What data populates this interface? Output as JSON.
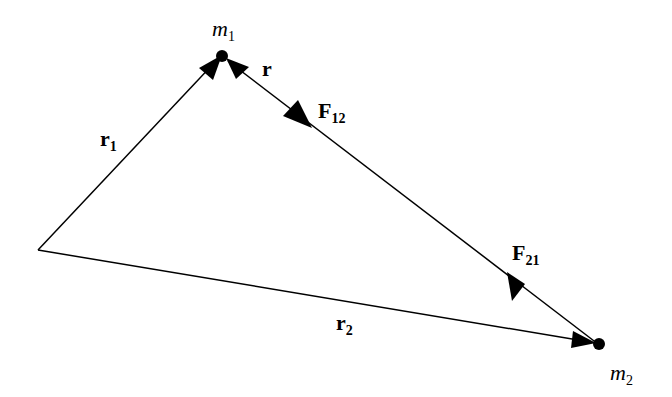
{
  "diagram": {
    "type": "gravitational-force-vectors",
    "points": {
      "origin": {
        "x": 38,
        "y": 250
      },
      "m1": {
        "x": 222,
        "y": 55
      },
      "m2": {
        "x": 598,
        "y": 344
      }
    },
    "labels": {
      "m1": {
        "base": "m",
        "sub": "1"
      },
      "m2": {
        "base": "m",
        "sub": "2"
      },
      "r": {
        "base": "r",
        "sub": ""
      },
      "r1": {
        "base": "r",
        "sub": "1"
      },
      "r2": {
        "base": "r",
        "sub": "2"
      },
      "F12": {
        "base": "F",
        "sub": "12"
      },
      "F21": {
        "base": "F",
        "sub": "21"
      }
    },
    "colors": {
      "stroke": "#000000",
      "background": "#ffffff"
    }
  }
}
